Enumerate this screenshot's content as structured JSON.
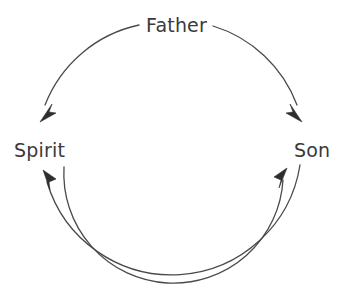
{
  "diagram": {
    "background_color": "#ffffff",
    "stroke_color": "#4a4a4a",
    "text_color": "#3a3a3a",
    "nodes": [
      {
        "id": "father",
        "label": "Father",
        "position": "top",
        "x": 171,
        "y": 24
      },
      {
        "id": "spirit",
        "label": "Spirit",
        "position": "left",
        "x": 41,
        "y": 150
      },
      {
        "id": "son",
        "label": "Son",
        "position": "right",
        "x": 311,
        "y": 150
      }
    ],
    "edges": [
      {
        "id": "father-to-spirit",
        "from": "Father",
        "to": "Spirit",
        "style": "arc",
        "arrowhead": "filled-barbed",
        "side": "outer-left"
      },
      {
        "id": "father-to-son",
        "from": "Father",
        "to": "Son",
        "style": "arc",
        "arrowhead": "filled-barbed",
        "side": "outer-right"
      },
      {
        "id": "son-to-spirit",
        "from": "Son",
        "to": "Spirit",
        "style": "arc",
        "arrowhead": "filled-barbed",
        "side": "outer-bottom"
      },
      {
        "id": "spirit-to-son",
        "from": "Spirit",
        "to": "Son",
        "style": "arc",
        "arrowhead": "filled-barbed",
        "side": "inner-bottom"
      }
    ],
    "geometry": {
      "outer_circle_center_x": 171,
      "outer_circle_center_y": 150,
      "outer_circle_radius": 130,
      "inner_arc_radius": 108
    }
  }
}
